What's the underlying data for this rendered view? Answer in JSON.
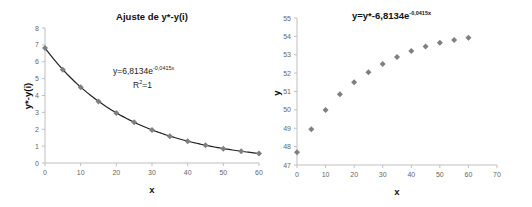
{
  "chart_data": [
    {
      "type": "scatter",
      "title": "Ajuste de y*-y(i)",
      "xlabel": "x",
      "ylabel": "y*-y(i)",
      "xlim": [
        0,
        60
      ],
      "ylim": [
        0,
        8
      ],
      "xticks": [
        0,
        10,
        20,
        30,
        40,
        50,
        60
      ],
      "yticks": [
        0,
        1,
        2,
        3,
        4,
        5,
        6,
        7,
        8
      ],
      "grid": false,
      "x": [
        0,
        5,
        10,
        15,
        20,
        25,
        30,
        35,
        40,
        45,
        50,
        55,
        60
      ],
      "series": [
        {
          "name": "y*-y(i)",
          "values": [
            6.81,
            5.53,
            4.49,
            3.65,
            2.96,
            2.41,
            1.96,
            1.59,
            1.29,
            1.05,
            0.85,
            0.69,
            0.56
          ]
        }
      ],
      "trendline": {
        "type": "exponential",
        "a": 6.8134,
        "b": -0.0415
      },
      "annotations": [
        "y=6,8134e-0,0415x",
        "R²=1"
      ]
    },
    {
      "type": "scatter",
      "title": "y=y*-6,8134e-0,0415x",
      "xlabel": "x",
      "ylabel": "y",
      "xlim": [
        0,
        70
      ],
      "ylim": [
        47,
        55
      ],
      "xticks": [
        0,
        10,
        20,
        30,
        40,
        50,
        60,
        70
      ],
      "yticks": [
        47,
        48,
        49,
        50,
        51,
        52,
        53,
        54,
        55
      ],
      "grid": false,
      "x": [
        0,
        5,
        10,
        15,
        20,
        25,
        30,
        35,
        40,
        45,
        50,
        55,
        60
      ],
      "series": [
        {
          "name": "y",
          "values": [
            47.7,
            48.95,
            50.0,
            50.85,
            51.5,
            52.05,
            52.5,
            52.88,
            53.2,
            53.45,
            53.65,
            53.8,
            53.92
          ]
        }
      ]
    }
  ],
  "left": {
    "title": "Ajuste de y*-y(i)",
    "xlabel": "x",
    "ylabel": "y*-y(i)",
    "eq_main": "y=6,8134e",
    "eq_exp": "-0,0415x",
    "r2_main": "R",
    "r2_sup": "2",
    "r2_rest": "=1"
  },
  "right": {
    "title_main": "y=y*-6,8134e",
    "title_exp": "-0,0415x",
    "xlabel": "x",
    "ylabel": "y"
  },
  "colors": {
    "marker": "#7f7f7f",
    "line": "#222222",
    "axis": "#bfbfbf"
  }
}
